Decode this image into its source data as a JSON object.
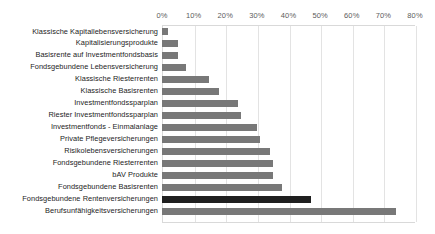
{
  "chart_data": {
    "type": "bar",
    "orientation": "horizontal",
    "title": "",
    "subtitle": "",
    "xlabel": "",
    "ylabel": "",
    "xlim": [
      0,
      80
    ],
    "grid": true,
    "legend": null,
    "xtick_labels": [
      "0%",
      "10%",
      "20%",
      "30%",
      "40%",
      "50%",
      "60%",
      "70%",
      "80%"
    ],
    "xtick_values": [
      0,
      10,
      20,
      30,
      40,
      50,
      60,
      70,
      80
    ],
    "value_unit": "%",
    "bar_color": "#787878",
    "highlight_color": "#1f1f1f",
    "highlight_category": "Fondsgebundene Rentenversicherungen",
    "categories": [
      "Klassische Kapitallebensversicherung",
      "Kapitalisierungsprodukte",
      "Basisrente auf Investmentfondsbasis",
      "Fondsgebundene Lebensversicherung",
      "Klassische Riesterrenten",
      "Klassische Basisrenten",
      "Investmentfondssparplan",
      "Riester Investmentfondssparplan",
      "Investmentfonds - Einmalanlage",
      "Private Pflegeversicherungen",
      "Risikolebensversicherungen",
      "Fondsgebundene Riesterrenten",
      "bAV Produkte",
      "Fondsgebundene Basisrenten",
      "Fondsgebundene Rentenversicherungen",
      "Berufsunfähigkeitsversicherungen"
    ],
    "values": [
      2,
      5,
      5,
      7.5,
      15,
      18,
      24,
      25,
      30,
      31,
      34,
      35,
      35,
      38,
      47,
      74
    ]
  }
}
